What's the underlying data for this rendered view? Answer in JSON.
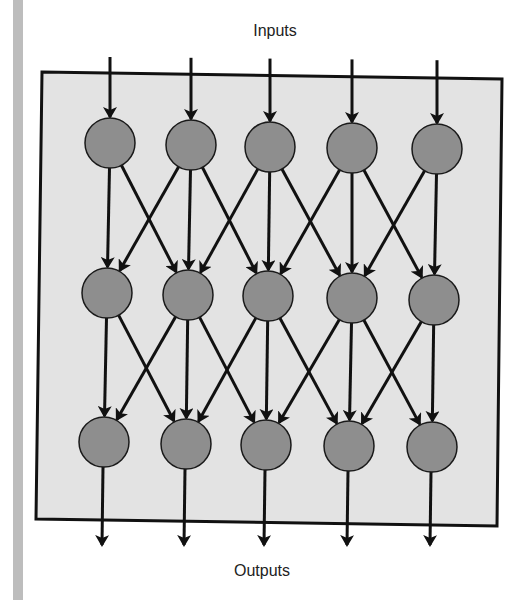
{
  "diagram": {
    "title_top": "Inputs",
    "title_bottom": "Outputs",
    "layers": [
      {
        "name": "layer-1",
        "nodes": 5
      },
      {
        "name": "layer-2",
        "nodes": 5
      },
      {
        "name": "layer-3",
        "nodes": 5
      }
    ],
    "connections": "each node connects to the node directly below and its immediate left/right neighbors in the next layer",
    "colors": {
      "node_fill": "#8e8e8e",
      "node_stroke": "#1a1a1a",
      "box_fill": "#e3e3e3",
      "box_stroke": "#111111",
      "edge": "#111111",
      "side_bar": "#bdbdbd"
    }
  }
}
